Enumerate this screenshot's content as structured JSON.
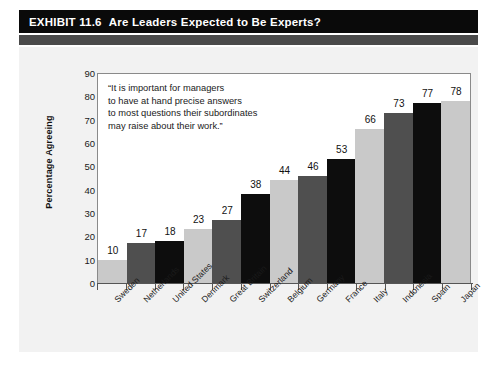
{
  "header": {
    "exhibit_number": "EXHIBIT 11.6",
    "title": "Are Leaders Expected to Be Experts?"
  },
  "quote": {
    "line1": "“It is important for managers",
    "line2": "to have at hand precise answers",
    "line3": "to most questions their subordinates",
    "line4": "may raise about their work.”"
  },
  "colors": {
    "header_bar": "#0a0a0a",
    "header_subband": "#4a4a4a",
    "panel": "#f2f2f2",
    "bar_light": "#c9c9c9",
    "bar_medium": "#4f4f4f",
    "bar_dark": "#0d0d0d",
    "plot_background": "#ffffff",
    "axis": "#555555"
  },
  "chart_data": {
    "type": "bar",
    "title": "Are Leaders Expected to Be Experts?",
    "xlabel": "",
    "ylabel": "Percentage Agreeing",
    "ylim": [
      0,
      90
    ],
    "yticks": [
      0,
      10,
      20,
      30,
      40,
      50,
      60,
      70,
      80,
      90
    ],
    "grid": false,
    "legend": "none",
    "annotation": "“It is important for managers to have at hand precise answers to most questions their subordinates may raise about their work.”",
    "categories": [
      "Sweden",
      "Netherlands",
      "United States",
      "Denmark",
      "Great Britain",
      "Switzerland",
      "Belgium",
      "Germany",
      "France",
      "Italy",
      "Indonesia",
      "Spain",
      "Japan"
    ],
    "values": [
      10,
      17,
      18,
      23,
      27,
      38,
      44,
      46,
      53,
      66,
      73,
      77,
      78
    ],
    "bar_color_cycle": [
      "#c9c9c9",
      "#4f4f4f",
      "#0d0d0d"
    ]
  }
}
